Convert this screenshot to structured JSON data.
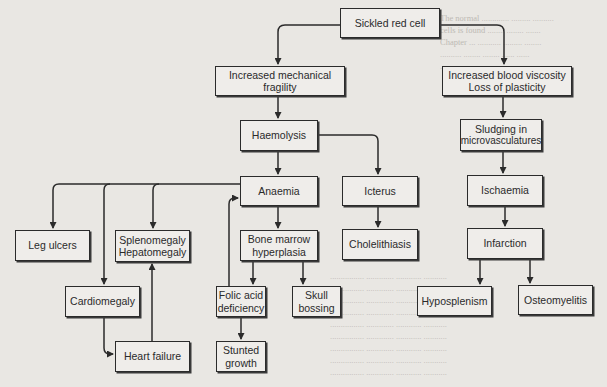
{
  "diagram": {
    "nodes": {
      "sickled": {
        "lines": [
          "Sickled red cell"
        ]
      },
      "fragility": {
        "lines": [
          "Increased mechanical",
          "fragility"
        ]
      },
      "viscosity": {
        "lines": [
          "Increased blood viscosity",
          "Loss of plasticity"
        ]
      },
      "haemolysis": {
        "lines": [
          "Haemolysis"
        ]
      },
      "sludging": {
        "lines": [
          "Sludging in",
          "microvasculatures"
        ]
      },
      "anaemia": {
        "lines": [
          "Anaemia"
        ]
      },
      "icterus": {
        "lines": [
          "Icterus"
        ]
      },
      "ischaemia": {
        "lines": [
          "Ischaemia"
        ]
      },
      "leg_ulcers": {
        "lines": [
          "Leg ulcers"
        ]
      },
      "spleno": {
        "lines": [
          "Splenomegaly",
          "Hepatomegaly"
        ]
      },
      "bone_marrow": {
        "lines": [
          "Bone marrow",
          "hyperplasia"
        ]
      },
      "cholelithiasis": {
        "lines": [
          "Cholelithiasis"
        ]
      },
      "infarction": {
        "lines": [
          "Infarction"
        ]
      },
      "cardiomegaly": {
        "lines": [
          "Cardiomegaly"
        ]
      },
      "folic": {
        "lines": [
          "Folic acid",
          "deficiency"
        ]
      },
      "skull": {
        "lines": [
          "Skull",
          "bossing"
        ]
      },
      "hyposplenism": {
        "lines": [
          "Hyposplenism"
        ]
      },
      "osteomyelitis": {
        "lines": [
          "Osteomyelitis"
        ]
      },
      "heart_failure": {
        "lines": [
          "Heart failure"
        ]
      },
      "stunted": {
        "lines": [
          "Stunted",
          "growth"
        ]
      }
    },
    "edges": [
      [
        "Sickled red cell",
        "Increased mechanical fragility"
      ],
      [
        "Sickled red cell",
        "Increased blood viscosity / Loss of plasticity"
      ],
      [
        "Increased mechanical fragility",
        "Haemolysis"
      ],
      [
        "Increased blood viscosity / Loss of plasticity",
        "Sludging in microvasculatures"
      ],
      [
        "Haemolysis",
        "Anaemia"
      ],
      [
        "Haemolysis",
        "Icterus"
      ],
      [
        "Sludging in microvasculatures",
        "Ischaemia"
      ],
      [
        "Anaemia",
        "Leg ulcers"
      ],
      [
        "Anaemia",
        "Cardiomegaly"
      ],
      [
        "Anaemia",
        "Splenomegaly / Hepatomegaly"
      ],
      [
        "Anaemia",
        "Bone marrow hyperplasia"
      ],
      [
        "Icterus",
        "Cholelithiasis"
      ],
      [
        "Ischaemia",
        "Infarction"
      ],
      [
        "Bone marrow hyperplasia",
        "Folic acid deficiency"
      ],
      [
        "Bone marrow hyperplasia",
        "Skull bossing"
      ],
      [
        "Folic acid deficiency",
        "Anaemia"
      ],
      [
        "Folic acid deficiency",
        "Stunted growth"
      ],
      [
        "Cardiomegaly",
        "Heart failure"
      ],
      [
        "Heart failure",
        "Splenomegaly / Hepatomegaly"
      ],
      [
        "Infarction",
        "Hyposplenism"
      ],
      [
        "Infarction",
        "Osteomyelitis"
      ]
    ],
    "colors": {
      "line": "#2b2b2b",
      "box_fill": "#efedea",
      "background": "#e9e7e3"
    }
  }
}
